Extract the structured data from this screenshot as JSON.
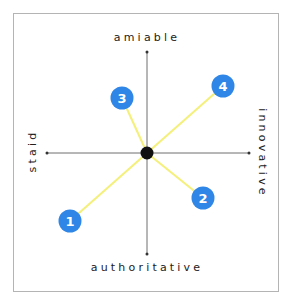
{
  "axes": {
    "top": "amiable",
    "bottom": "authoritative",
    "left": "staid",
    "right": "innovative"
  },
  "colors": {
    "node": "#2f86e6",
    "connector": "#f4f07a",
    "axis": "#6e6e6e",
    "center": "#111111",
    "frame": "#b4b4b4"
  },
  "nodes": [
    {
      "id": "1",
      "label": "1",
      "x": 70,
      "y": 221
    },
    {
      "id": "2",
      "label": "2",
      "x": 203,
      "y": 198
    },
    {
      "id": "3",
      "label": "3",
      "x": 122,
      "y": 98
    },
    {
      "id": "4",
      "label": "4",
      "x": 223,
      "y": 86
    }
  ],
  "center": {
    "x": 147,
    "y": 153
  }
}
